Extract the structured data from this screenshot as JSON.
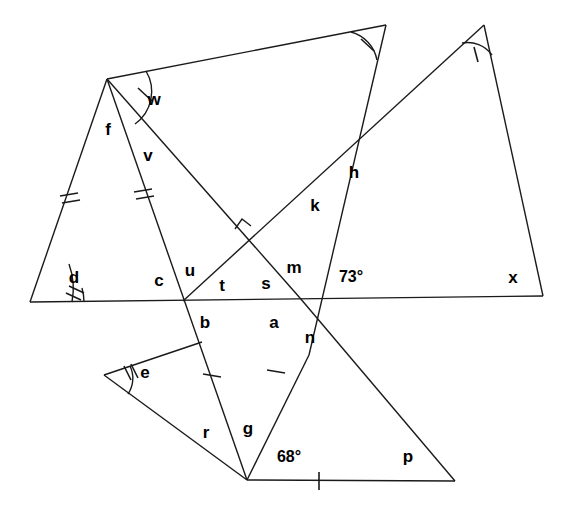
{
  "figure": {
    "width": 572,
    "height": 514,
    "background": "#ffffff",
    "stroke_color": "#1a1a1a",
    "text_color": "#000000"
  },
  "vertices": {
    "A_top_left": {
      "x": 107,
      "y": 79,
      "name": "top-left-apex"
    },
    "B_top_center": {
      "x": 386,
      "y": 25,
      "name": "top-center-apex"
    },
    "C_right_apex": {
      "x": 484,
      "y": 25,
      "name": "right-triangle-apex"
    },
    "D_left_base": {
      "x": 30,
      "y": 302,
      "name": "left-base-vertex"
    },
    "E_right_base": {
      "x": 543,
      "y": 296,
      "name": "right-base-vertex"
    },
    "F_left_cross": {
      "x": 183,
      "y": 301,
      "name": "left-intersection"
    },
    "G_right_cross": {
      "x": 300,
      "y": 298,
      "name": "right-intersection"
    },
    "H_h_cross": {
      "x": 342,
      "y": 155,
      "name": "h-intersection"
    },
    "I_mid_cross": {
      "x": 243,
      "y": 230,
      "name": "perpendicular-intersection"
    },
    "J_e_vertex": {
      "x": 104,
      "y": 375,
      "name": "e-vertex"
    },
    "K_bottom_apex": {
      "x": 247,
      "y": 480,
      "name": "bottom-apex"
    },
    "L_bottom_right": {
      "x": 455,
      "y": 481,
      "name": "bottom-right-vertex"
    },
    "M_left_tri_foot": {
      "x": 202,
      "y": 342,
      "name": "left-triangle-lower-end"
    },
    "N_n_point": {
      "x": 309,
      "y": 355,
      "name": "n-segment-point"
    }
  },
  "segments": [
    {
      "id": "base-long",
      "from": "D_left_base",
      "to": "E_right_base",
      "name": "long-horizontal-baseline"
    },
    {
      "id": "left-side-f",
      "from": "A_top_left",
      "to": "D_left_base",
      "name": "segment-f-side"
    },
    {
      "id": "top-ridge",
      "from": "A_top_left",
      "to": "B_top_center",
      "name": "top-ridge-segment"
    },
    {
      "id": "v-line",
      "from": "A_top_left",
      "to": "K_bottom_apex",
      "name": "segment-v-to-bottom-apex"
    },
    {
      "id": "w-diagonal",
      "from": "A_top_left",
      "to": "G_right_cross",
      "name": "segment-w-diagonal"
    },
    {
      "id": "b-down",
      "from": "B_top_center",
      "to": "N_n_point",
      "name": "segment-top-center-down"
    },
    {
      "id": "c-apex-line",
      "from": "C_right_apex",
      "to": "F_left_cross",
      "name": "segment-right-apex-to-left-cross"
    },
    {
      "id": "x-side",
      "from": "C_right_apex",
      "to": "E_right_base",
      "name": "segment-x-side"
    },
    {
      "id": "e-upper",
      "from": "J_e_vertex",
      "to": "M_left_tri_foot",
      "name": "segment-e-upper"
    },
    {
      "id": "r-side",
      "from": "J_e_vertex",
      "to": "K_bottom_apex",
      "name": "segment-r-side"
    },
    {
      "id": "g-side",
      "from": "K_bottom_apex",
      "to": "N_n_point",
      "name": "segment-g-side"
    },
    {
      "id": "p-base",
      "from": "K_bottom_apex",
      "to": "L_bottom_right",
      "name": "segment-p-base"
    },
    {
      "id": "p-diagonal",
      "from": "L_bottom_right",
      "to": "G_right_cross",
      "name": "segment-p-diagonal"
    }
  ],
  "labels": [
    {
      "text": "w",
      "x": 154,
      "y": 99,
      "name": "angle-label-w"
    },
    {
      "text": "f",
      "x": 108,
      "y": 129,
      "name": "angle-label-f"
    },
    {
      "text": "v",
      "x": 148,
      "y": 155,
      "name": "angle-label-v"
    },
    {
      "text": "d",
      "x": 74,
      "y": 277,
      "name": "angle-label-d"
    },
    {
      "text": "c",
      "x": 159,
      "y": 280,
      "name": "angle-label-c"
    },
    {
      "text": "u",
      "x": 190,
      "y": 270,
      "name": "angle-label-u"
    },
    {
      "text": "t",
      "x": 222,
      "y": 285,
      "name": "angle-label-t"
    },
    {
      "text": "b",
      "x": 205,
      "y": 322,
      "name": "angle-label-b"
    },
    {
      "text": "s",
      "x": 266,
      "y": 283,
      "name": "angle-label-s"
    },
    {
      "text": "m",
      "x": 294,
      "y": 267,
      "name": "angle-label-m"
    },
    {
      "text": "a",
      "x": 274,
      "y": 322,
      "name": "angle-label-a"
    },
    {
      "text": "n",
      "x": 310,
      "y": 337,
      "name": "angle-label-n"
    },
    {
      "text": "k",
      "x": 315,
      "y": 205,
      "name": "angle-label-k"
    },
    {
      "text": "h",
      "x": 354,
      "y": 172,
      "name": "angle-label-h"
    },
    {
      "text": "x",
      "x": 513,
      "y": 277,
      "name": "angle-label-x"
    },
    {
      "text": "e",
      "x": 145,
      "y": 372,
      "name": "angle-label-e"
    },
    {
      "text": "r",
      "x": 206,
      "y": 432,
      "name": "angle-label-r"
    },
    {
      "text": "g",
      "x": 248,
      "y": 428,
      "name": "angle-label-g"
    },
    {
      "text": "p",
      "x": 408,
      "y": 456,
      "name": "angle-label-p"
    },
    {
      "text": "73°",
      "x": 351,
      "y": 277,
      "name": "angle-value-73"
    },
    {
      "text": "68°",
      "x": 289,
      "y": 457,
      "name": "angle-value-68"
    }
  ],
  "angle_arcs": [
    {
      "name": "arc-w",
      "vertex": "A_top_left",
      "arcs": 1,
      "ticks": 1
    },
    {
      "name": "arc-d",
      "vertex": "D_left_base",
      "arcs": 2,
      "ticks": 2
    },
    {
      "name": "arc-e",
      "vertex": "J_e_vertex",
      "arcs": 1,
      "ticks": 2
    },
    {
      "name": "arc-top-center",
      "vertex": "B_top_center",
      "arcs": 1,
      "ticks": 1
    },
    {
      "name": "arc-right-apex",
      "vertex": "C_right_apex",
      "arcs": 1,
      "ticks": 1
    }
  ],
  "side_ticks": [
    {
      "name": "tick-left-f-side",
      "segment": "left-side-f",
      "count": 2
    },
    {
      "name": "tick-v-upper",
      "segment": "v-line",
      "count": 2
    },
    {
      "name": "tick-r-side",
      "segment": "r-side",
      "count": 1
    },
    {
      "name": "tick-g-side",
      "segment": "g-side",
      "count": 1
    },
    {
      "name": "tick-p-base",
      "segment": "p-base",
      "count": 1
    }
  ],
  "right_angle": {
    "name": "right-angle-marker",
    "x": 243,
    "y": 230,
    "size": 11
  }
}
